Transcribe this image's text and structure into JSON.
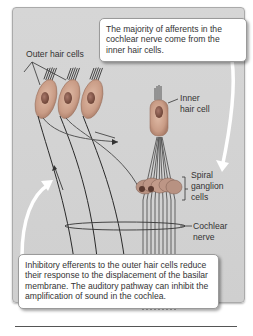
{
  "figure": {
    "callouts": {
      "afferents": "The majority of afferents in the cochlear nerve come from the inner hair cells.",
      "efferents": "Inhibitory efferents to the outer hair cells reduce their response to the displacement of the basilar membrane. The auditory pathway can inhibit the amplification of sound in the cochlea."
    },
    "labels": {
      "outer_hair_cells": "Outer hair cells",
      "inner_hair_cell_1": "Inner",
      "inner_hair_cell_2": "hair cell",
      "spiral_1": "Spiral",
      "spiral_2": "ganglion",
      "spiral_3": "cells",
      "cochlear_1": "Cochlear",
      "cochlear_2": "nerve"
    },
    "colors": {
      "panel_bg": "#d3d3d3",
      "cell_fill": "#c9a08a",
      "nucleus": "#8a5f50",
      "fiber": "#2a2a2a",
      "arrow": "#ffffff"
    }
  }
}
